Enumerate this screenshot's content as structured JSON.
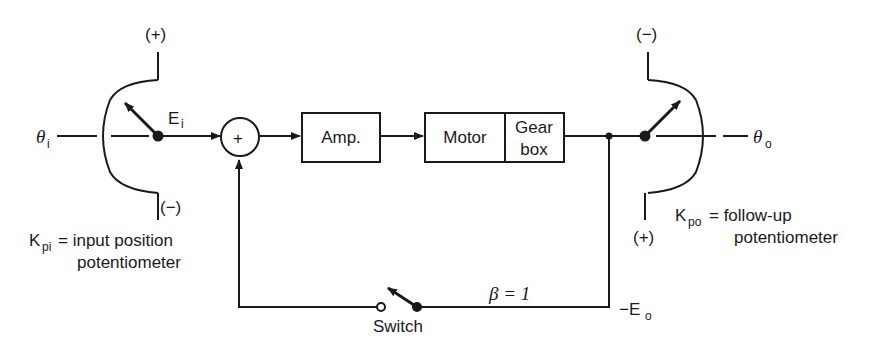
{
  "diagram": {
    "type": "block-diagram",
    "input": {
      "symbol": "θ",
      "subscript": "i"
    },
    "output": {
      "symbol": "θ",
      "subscript": "o"
    },
    "input_pot": {
      "top_polarity": "(+)",
      "bottom_polarity": "(−)",
      "voltage_symbol": "E",
      "voltage_subscript": "i",
      "label_symbol": "K",
      "label_subscript": "pi",
      "label_line1": "= input position",
      "label_line2": "potentiometer"
    },
    "summing_junction": {
      "sign": "+"
    },
    "blocks": [
      {
        "id": "amp",
        "label": "Amp."
      },
      {
        "id": "motor",
        "label": "Motor"
      },
      {
        "id": "gearbox",
        "label_line1": "Gear",
        "label_line2": "box"
      }
    ],
    "followup_pot": {
      "top_polarity": "(−)",
      "bottom_polarity": "(+)",
      "label_symbol": "K",
      "label_subscript": "po",
      "label_line1": "= follow-up",
      "label_line2": "potentiometer"
    },
    "feedback": {
      "gain_label": "β = 1",
      "voltage_prefix": "−E",
      "voltage_subscript": "o",
      "switch_label": "Switch"
    }
  }
}
